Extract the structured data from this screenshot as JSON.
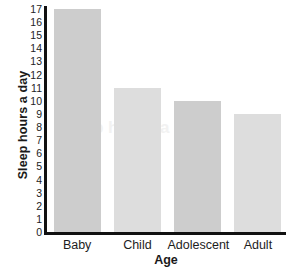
{
  "chart_data": {
    "type": "bar",
    "title": "",
    "categories": [
      "Baby",
      "Child",
      "Adolescent",
      "Adult"
    ],
    "values": [
      17,
      11,
      10,
      9
    ],
    "xlabel": "Age",
    "ylabel": "Sleep hours a day",
    "ylim": [
      0,
      17
    ],
    "ytick_labels": [
      "0",
      "1",
      "2",
      "3",
      "4",
      "5",
      "6",
      "7",
      "8",
      "9",
      "10",
      "11",
      "12",
      "13",
      "14",
      "15",
      "16",
      "17"
    ],
    "grid": false,
    "legend": "none",
    "bar_colors": [
      "#cdcdcd",
      "#dddddd",
      "#cdcdcd",
      "#dddddd"
    ],
    "axis_color": "#111111"
  },
  "axes": {
    "y_title": "Sleep hours a day",
    "x_title": "Age"
  },
  "watermark": {
    "line1": "Sleep",
    "line2": "Sleep hours a day"
  }
}
